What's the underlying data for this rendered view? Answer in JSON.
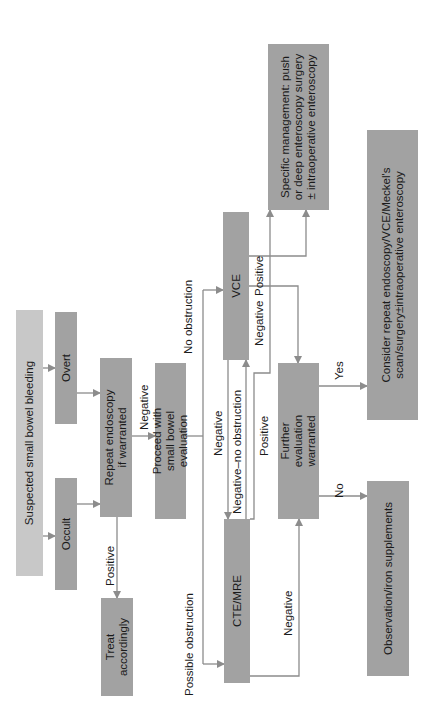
{
  "diagram": {
    "orientation": "rotated-90-ccw",
    "nodes": {
      "suspected": "Suspected small bowel bleeding",
      "overt": "Overt",
      "occult": "Occult",
      "repeat_endoscopy": "Repeat endoscopy if warranted",
      "treat": "Treat accordingly",
      "proceed": "Proceed with small bowel evaluation",
      "cte_mre": "CTE/MRE",
      "vce": "VCE",
      "further_eval": "Further evaluation warranted",
      "specific_mgmt": "Specific management: push or deep enteroscopy surgery ± intraoperative enteroscopy",
      "consider": "Consider repeat endoscopy/VCE/Meckel's scan/surgery±intraoperative enteroscopy",
      "observation": "Observation/iron supplements"
    },
    "edge_labels": {
      "positive_repeat": "Positive",
      "negative_repeat": "Negative",
      "no_obstruction": "No obstruction",
      "possible_obstruction": "Possible obstruction",
      "negative_vce_to_cte": "Negative",
      "negative_no_obstruction": "Negative–no obstruction",
      "positive_cte": "Positive",
      "negative_cte": "Negative",
      "negative_vce": "Negative",
      "positive_vce": "Positive",
      "yes": "Yes",
      "no": "No"
    },
    "colors": {
      "start_box": "#c8c8c8",
      "box": "#a2a2a2",
      "arrow": "#8c8c8c",
      "text": "#1a1a1a"
    }
  }
}
